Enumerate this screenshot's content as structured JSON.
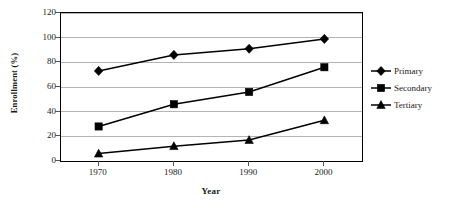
{
  "chart_data": {
    "type": "line",
    "title": "",
    "xlabel": "Year",
    "ylabel": "Enrollment (%)",
    "categories": [
      "1970",
      "1980",
      "1990",
      "2000"
    ],
    "x": [
      1970,
      1980,
      1990,
      2000
    ],
    "xlim": [
      1965,
      2005
    ],
    "ylim": [
      0,
      120
    ],
    "yticks": [
      0,
      20,
      40,
      60,
      80,
      100,
      120
    ],
    "ytick_labels": [
      "0",
      "20",
      "40",
      "60",
      "80",
      "100",
      "120"
    ],
    "grid": "horizontal",
    "legend_position": "right",
    "series": [
      {
        "name": "Primary",
        "marker": "diamond",
        "color": "#000000",
        "values": [
          73,
          86,
          91,
          99
        ]
      },
      {
        "name": "Secondary",
        "marker": "square",
        "color": "#000000",
        "values": [
          28,
          46,
          56,
          76
        ]
      },
      {
        "name": "Tertiary",
        "marker": "triangle",
        "color": "#000000",
        "values": [
          6,
          12,
          17,
          33
        ]
      }
    ]
  },
  "axis": {
    "y_title": "Enrollment (%)",
    "x_title": "Year"
  },
  "legend": {
    "items": [
      {
        "label": "Primary"
      },
      {
        "label": "Secondary"
      },
      {
        "label": "Tertiary"
      }
    ]
  },
  "colors": {
    "ink": "#000000",
    "grid": "#b4b4b4",
    "frame": "#000000",
    "background": "#ffffff"
  }
}
